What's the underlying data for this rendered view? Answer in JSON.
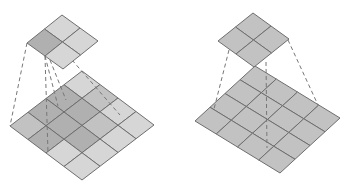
{
  "diagram": {
    "colors": {
      "cell_light": "#d6d6d6",
      "cell_mid": "#c2c2c2",
      "cell_dark": "#b0b0b0",
      "grid_line": "#6e6e6e",
      "dash_line": "#777777",
      "background": "#ffffff"
    },
    "panels": [
      {
        "id": "left",
        "input": {
          "rows": 4,
          "cols": 4,
          "top": [
            82,
            71
          ],
          "u": [
            18,
            13.5
          ],
          "v": [
            -18,
            13.75
          ],
          "shade": [
            [
              "light",
              "mid",
              "light",
              "light"
            ],
            [
              "dark",
              "dark",
              "mid",
              "light"
            ],
            [
              "dark",
              "dark",
              "dark",
              "light"
            ],
            [
              "mid",
              "dark",
              "light",
              "light"
            ]
          ]
        },
        "output": {
          "rows": 2,
          "cols": 2,
          "top": [
            62,
            15
          ],
          "u": [
            18,
            13
          ],
          "v": [
            -17.5,
            14
          ],
          "shade": [
            [
              "light",
              "light"
            ],
            [
              "dark",
              "light"
            ]
          ]
        },
        "dashes": [
          [
            [
              27,
              43
            ],
            [
              10,
              126
            ]
          ],
          [
            [
              45,
              56
            ],
            [
              48,
              153
            ]
          ],
          [
            [
              45,
              56
            ],
            [
              58,
              106
            ]
          ],
          [
            [
              50,
              60
            ],
            [
              66,
              100
            ]
          ],
          [
            [
              72,
              60
            ],
            [
              120,
              115
            ]
          ]
        ]
      },
      {
        "id": "right",
        "input": {
          "rows": 4,
          "cols": 4,
          "top": [
            255,
            66
          ],
          "u": [
            21.25,
            13
          ],
          "v": [
            -15,
            13.75
          ],
          "shade": [
            [
              "mid",
              "mid",
              "mid",
              "mid"
            ],
            [
              "mid",
              "mid",
              "mid",
              "mid"
            ],
            [
              "mid",
              "mid",
              "mid",
              "mid"
            ],
            [
              "mid",
              "mid",
              "mid",
              "mid"
            ]
          ]
        },
        "output": {
          "rows": 2,
          "cols": 2,
          "top": [
            253,
            13
          ],
          "u": [
            18,
            13
          ],
          "v": [
            -17.5,
            14
          ],
          "shade": [
            [
              "mid",
              "mid"
            ],
            [
              "mid",
              "mid"
            ]
          ]
        },
        "dashes": [
          [
            [
              229,
              50
            ],
            [
              214,
              109
            ]
          ],
          [
            [
              266,
              62
            ],
            [
              267,
              148
            ]
          ],
          [
            [
              288,
              40
            ],
            [
              318,
              105
            ]
          ]
        ]
      }
    ]
  }
}
